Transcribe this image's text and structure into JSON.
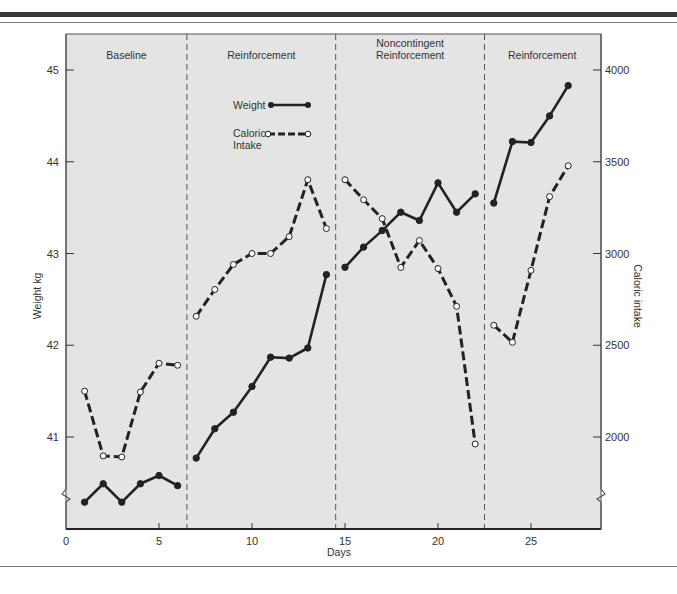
{
  "chart_data": {
    "type": "line",
    "title": "",
    "xlabel": "Days",
    "ylabel": "Weight kg",
    "y2label": "Caloric intake",
    "xlim": [
      0,
      28.7
    ],
    "ylim": [
      40.0,
      45.4
    ],
    "y2lim": [
      1500,
      4200
    ],
    "xticks": [
      0,
      5,
      10,
      15,
      20,
      25
    ],
    "yticks": [
      41,
      42,
      43,
      44,
      45
    ],
    "y2ticks": [
      2000,
      2500,
      3000,
      3500,
      4000
    ],
    "grid": false,
    "legend_position": "top-center",
    "phases": [
      {
        "label": "Baseline",
        "start": 0,
        "end": 6.5
      },
      {
        "label": "Reinforcement",
        "start": 6.5,
        "end": 14.5
      },
      {
        "label": "Noncontingent\nReinforcement",
        "start": 14.5,
        "end": 22.5
      },
      {
        "label": "Reinforcement",
        "start": 22.5,
        "end": 28.7
      }
    ],
    "series": [
      {
        "name": "Weight",
        "axis": "left",
        "style": "solid-filled-markers",
        "segments": [
          {
            "x": [
              1,
              2,
              3,
              4,
              5,
              6
            ],
            "y": [
              40.29,
              40.49,
              40.29,
              40.49,
              40.58,
              40.47
            ]
          },
          {
            "x": [
              7,
              8,
              9,
              10,
              11,
              12,
              13,
              14
            ],
            "y": [
              40.77,
              41.09,
              41.27,
              41.55,
              41.87,
              41.86,
              41.97,
              42.77
            ]
          },
          {
            "x": [
              15,
              16,
              17,
              18,
              19,
              20,
              21,
              22
            ],
            "y": [
              42.85,
              43.07,
              43.25,
              43.45,
              43.36,
              43.77,
              43.45,
              43.65
            ]
          },
          {
            "x": [
              23,
              24,
              25,
              26,
              27
            ],
            "y": [
              43.55,
              44.22,
              44.21,
              44.5,
              44.83
            ]
          }
        ]
      },
      {
        "name": "Caloric Intake",
        "axis": "right",
        "style": "dashed-open-markers",
        "segments": [
          {
            "x": [
              1,
              2,
              3,
              4,
              5,
              6
            ],
            "y": [
              2250,
              1897,
              1891,
              2245,
              2402,
              2391
            ]
          },
          {
            "x": [
              7,
              8,
              9,
              10,
              11,
              12,
              13,
              14
            ],
            "y": [
              2658,
              2804,
              2940,
              3000,
              3000,
              3092,
              3402,
              3136
            ]
          },
          {
            "x": [
              15,
              16,
              17,
              18,
              19,
              20,
              21,
              22
            ],
            "y": [
              3402,
              3293,
              3190,
              2924,
              3071,
              2918,
              2712,
              1962
            ]
          },
          {
            "x": [
              23,
              24,
              25,
              26,
              27
            ],
            "y": [
              2609,
              2516,
              2908,
              3310,
              3478
            ]
          }
        ]
      }
    ],
    "legend": [
      {
        "label": "Weight"
      },
      {
        "label": "Caloric\nIntake"
      }
    ]
  }
}
